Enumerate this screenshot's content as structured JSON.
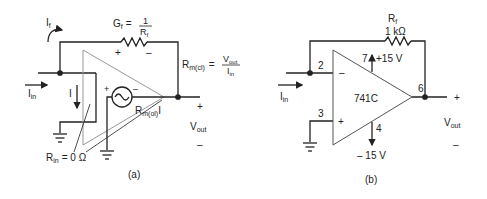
{
  "diagram_a": {
    "caption": "(a)",
    "if_label": "I",
    "if_sub": "f",
    "gf_label": "G",
    "gf_sub": "f",
    "gf_eq": "=",
    "gf_num": "1",
    "gf_den": "R",
    "gf_den_sub": "f",
    "fb_plus": "+",
    "fb_minus": "–",
    "rmcl_label": "R",
    "rmcl_sub": "m(cl)",
    "rmcl_eq": "=",
    "rmcl_num": "V",
    "rmcl_num_sub": "out",
    "rmcl_den": "I",
    "rmcl_den_sub": "in",
    "iin_label": "I",
    "iin_sub": "in",
    "i_label": "I",
    "src_plus": "+",
    "src_minus": "–",
    "rmol_label": "R",
    "rmol_sub": "m(ol)",
    "rmol_tail": "I",
    "out_plus": "+",
    "vout_label": "V",
    "vout_sub": "out",
    "out_minus": "–",
    "rin_label": "R",
    "rin_sub": "in",
    "rin_value": "= 0 Ω"
  },
  "diagram_b": {
    "caption": "(b)",
    "rf_label": "R",
    "rf_sub": "f",
    "rf_value": "1 kΩ",
    "pin2": "2",
    "pin3": "3",
    "pin4": "4",
    "pin6": "6",
    "pin7": "7",
    "vpos": "+15 V",
    "vneg": "– 15 V",
    "opamp_label": "741C",
    "inv_sign": "–",
    "noninv_sign": "+",
    "iin_label": "I",
    "iin_sub": "in",
    "out_plus": "+",
    "vout_label": "V",
    "vout_sub": "out",
    "out_minus": "–"
  }
}
